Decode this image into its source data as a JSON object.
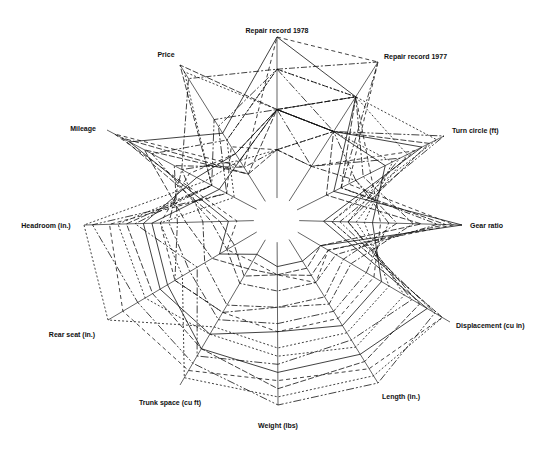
{
  "chart_data": {
    "type": "radar",
    "title": "",
    "center": [
      277,
      220
    ],
    "axes": [
      {
        "name": "Repair record 1978",
        "end": [
          277,
          37
        ],
        "label_pos": [
          277,
          32
        ],
        "anchor": "middle"
      },
      {
        "name": "Repair record 1977",
        "end": [
          378,
          62
        ],
        "label_pos": [
          384,
          58
        ],
        "anchor": "start"
      },
      {
        "name": "Turn circle (ft)",
        "end": [
          444,
          136
        ],
        "label_pos": [
          450,
          130
        ],
        "anchor": "start"
      },
      {
        "name": "Gear ratio",
        "end": [
          462,
          225
        ],
        "label_pos": [
          469,
          228
        ],
        "anchor": "start"
      },
      {
        "name": "Displacement (cu in)",
        "end": [
          450,
          322
        ],
        "label_pos": [
          456,
          327
        ],
        "anchor": "start"
      },
      {
        "name": "Length (in.)",
        "end": [
          378,
          383
        ],
        "label_pos": [
          382,
          398
        ],
        "anchor": "start"
      },
      {
        "name": "Weight (lbs)",
        "end": [
          278,
          405
        ],
        "label_pos": [
          278,
          427
        ],
        "anchor": "middle"
      },
      {
        "name": "Trunk space (cu ft)",
        "end": [
          180,
          385
        ],
        "label_pos": [
          173,
          404
        ],
        "anchor": "middle"
      },
      {
        "name": "Rear seat (in.)",
        "end": [
          108,
          320
        ],
        "label_pos": [
          72,
          336
        ],
        "anchor": "middle"
      },
      {
        "name": "Headroom (in.)",
        "end": [
          84,
          225
        ],
        "label_pos": [
          48,
          228
        ],
        "anchor": "middle"
      },
      {
        "name": "Mileage",
        "end": [
          107,
          130
        ],
        "label_pos": [
          82,
          130
        ],
        "anchor": "middle"
      },
      {
        "name": "Price",
        "end": [
          180,
          65
        ],
        "label_pos": [
          167,
          55
        ],
        "anchor": "middle"
      }
    ],
    "series_count": 74,
    "series_values": [
      [
        0.55,
        0.5,
        0.85,
        0.15,
        0.85,
        0.8,
        0.8,
        0.75,
        0.6,
        0.6,
        0.25,
        0.3
      ],
      [
        0.55,
        0.75,
        0.3,
        0.9,
        0.2,
        0.25,
        0.2,
        0.2,
        0.3,
        0.4,
        0.75,
        0.2
      ],
      [
        0.8,
        0.75,
        0.95,
        0.2,
        0.95,
        0.95,
        0.95,
        0.95,
        0.5,
        0.55,
        0.15,
        0.45
      ],
      [
        0.3,
        0.25,
        0.4,
        0.6,
        0.3,
        0.4,
        0.4,
        0.5,
        0.55,
        0.45,
        0.55,
        0.25
      ],
      [
        1.0,
        1.0,
        0.35,
        0.95,
        0.2,
        0.3,
        0.2,
        0.15,
        0.2,
        0.1,
        0.95,
        0.25
      ],
      [
        0.8,
        0.5,
        1.0,
        0.25,
        0.9,
        1.0,
        1.0,
        0.85,
        0.8,
        0.95,
        0.2,
        0.55
      ],
      [
        0.55,
        0.5,
        0.6,
        0.45,
        0.55,
        0.6,
        0.55,
        0.65,
        0.65,
        0.65,
        0.4,
        0.35
      ],
      [
        0.3,
        0.5,
        0.2,
        0.75,
        0.15,
        0.2,
        0.2,
        0.25,
        0.15,
        0.2,
        0.9,
        0.2
      ],
      [
        0.55,
        0.75,
        0.75,
        0.35,
        0.7,
        0.75,
        0.7,
        0.65,
        0.75,
        0.8,
        0.3,
        0.95
      ],
      [
        0.8,
        0.75,
        0.45,
        0.7,
        0.35,
        0.45,
        0.4,
        0.45,
        0.35,
        0.3,
        0.5,
        0.9
      ],
      [
        0.3,
        0.25,
        0.8,
        0.2,
        0.95,
        0.9,
        0.85,
        0.9,
        0.9,
        0.85,
        0.2,
        0.4
      ],
      [
        0.55,
        0.5,
        0.4,
        0.55,
        0.45,
        0.5,
        0.5,
        0.55,
        0.45,
        0.5,
        0.5,
        0.3
      ],
      [
        1.0,
        0.75,
        0.25,
        1.0,
        0.15,
        0.15,
        0.15,
        0.1,
        0.25,
        0.15,
        0.85,
        0.5
      ],
      [
        0.55,
        0.5,
        0.9,
        0.3,
        0.8,
        0.85,
        0.9,
        0.75,
        0.7,
        0.75,
        0.3,
        1.0
      ],
      [
        0.3,
        0.5,
        0.65,
        0.4,
        0.6,
        0.65,
        0.65,
        0.6,
        1.0,
        1.0,
        0.35,
        0.3
      ],
      [
        0.8,
        1.0,
        0.3,
        0.85,
        0.25,
        0.3,
        0.3,
        0.3,
        0.2,
        0.25,
        0.7,
        0.45
      ],
      [
        0.55,
        0.75,
        0.5,
        0.5,
        0.5,
        0.55,
        0.55,
        0.5,
        0.55,
        0.55,
        0.45,
        0.35
      ],
      [
        0.55,
        0.25,
        0.7,
        0.3,
        0.75,
        0.7,
        0.75,
        0.8,
        0.4,
        0.7,
        0.3,
        0.6
      ]
    ]
  },
  "labels": {
    "a0": "Repair record 1978",
    "a1": "Repair record 1977",
    "a2": "Turn circle (ft)",
    "a3": "Gear ratio",
    "a4": "Displacement (cu in)",
    "a5": "Length (in.)",
    "a6": "Weight (lbs)",
    "a7": "Trunk space (cu ft)",
    "a8": "Rear seat (in.)",
    "a9": "Headroom (in.)",
    "a10": "Mileage",
    "a11": "Price"
  },
  "style": {
    "line_color": "#111111",
    "background": "#ffffff"
  }
}
